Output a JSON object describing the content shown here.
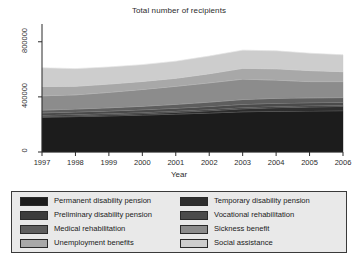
{
  "chart_data": {
    "type": "area",
    "title": "Total number of recipients",
    "xlabel": "Year",
    "ylabel": "",
    "stacked": true,
    "grid": false,
    "legend_position": "bottom",
    "categories": [
      "1997",
      "1998",
      "1999",
      "2000",
      "2001",
      "2002",
      "2003",
      "2004",
      "2005",
      "2006"
    ],
    "x": [
      1997,
      1998,
      1999,
      2000,
      2001,
      2002,
      2003,
      2004,
      2005,
      2006
    ],
    "xlim": [
      1997,
      2006
    ],
    "ylim": [
      0,
      900000
    ],
    "yticks": [
      0,
      400000,
      800000
    ],
    "ytick_labels": [
      "0",
      "400000",
      "800000"
    ],
    "xtick_labels": [
      "1997",
      "1998",
      "1999",
      "2000",
      "2001",
      "2002",
      "2003",
      "2004",
      "2005",
      "2006"
    ],
    "series": [
      {
        "name": "Permanent disability pension",
        "color": "#1c1c1c",
        "values": [
          252000,
          257000,
          262000,
          268000,
          275000,
          283000,
          292000,
          296000,
          298000,
          300000
        ]
      },
      {
        "name": "Temporary disability pension",
        "color": "#2e2e2e",
        "values": [
          6000,
          7000,
          8000,
          10000,
          13000,
          17000,
          22000,
          26000,
          29000,
          31000
        ]
      },
      {
        "name": "Preliminary disability pension",
        "color": "#3c3c3c",
        "values": [
          9000,
          9000,
          9000,
          9000,
          9000,
          9000,
          9000,
          9000,
          9000,
          9000
        ]
      },
      {
        "name": "Vocational rehabilitation",
        "color": "#4b4b4b",
        "values": [
          17000,
          18000,
          19000,
          20000,
          21000,
          22000,
          23000,
          23000,
          22000,
          21000
        ]
      },
      {
        "name": "Medical rehabilitation",
        "color": "#5e5e5e",
        "values": [
          20000,
          21000,
          23000,
          25000,
          28000,
          31000,
          35000,
          36000,
          35000,
          34000
        ]
      },
      {
        "name": "Sickness benefit",
        "color": "#8c8c8c",
        "values": [
          104000,
          103000,
          112000,
          122000,
          131000,
          140000,
          148000,
          132000,
          118000,
          116000
        ]
      },
      {
        "name": "Unemployment benefits",
        "color": "#a8a8a8",
        "values": [
          68000,
          62000,
          60000,
          58000,
          58000,
          66000,
          78000,
          82000,
          80000,
          72000
        ]
      },
      {
        "name": "Social assistance",
        "color": "#cdcdcd",
        "values": [
          135000,
          128000,
          124000,
          122000,
          124000,
          128000,
          132000,
          130000,
          126000,
          122000
        ]
      }
    ]
  },
  "legend": {
    "entries": [
      {
        "label": "Permanent disability pension",
        "color": "#1c1c1c"
      },
      {
        "label": "Temporary disability pension",
        "color": "#2e2e2e"
      },
      {
        "label": "Preliminary disability pension",
        "color": "#3c3c3c"
      },
      {
        "label": "Vocational rehabilitation",
        "color": "#4b4b4b"
      },
      {
        "label": "Medical rehabilitation",
        "color": "#5e5e5e"
      },
      {
        "label": "Sickness benefit",
        "color": "#8c8c8c"
      },
      {
        "label": "Unemployment benefits",
        "color": "#a8a8a8"
      },
      {
        "label": "Social assistance",
        "color": "#cdcdcd"
      }
    ]
  },
  "axis": {
    "color": "#2b2b2b"
  }
}
